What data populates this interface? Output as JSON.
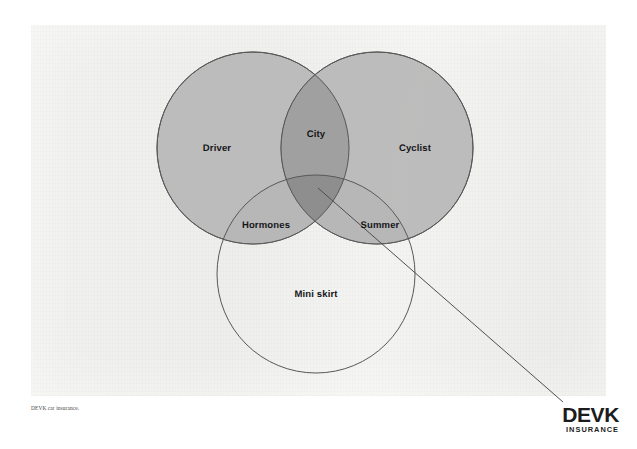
{
  "poster": {
    "background_color": "#f0f0ee",
    "page_color": "#ffffff"
  },
  "diagram": {
    "type": "venn",
    "set_count": 3,
    "fill_color": "#b5b5b5",
    "stroke_color": "#5a5a5a",
    "overlap_color": "#9a9a9a",
    "triple_overlap_color": "#8a8a8a",
    "sets": [
      {
        "id": "driver",
        "label": "Driver",
        "filled": true,
        "label_x": 217,
        "label_y": 148
      },
      {
        "id": "cyclist",
        "label": "Cyclist",
        "filled": true,
        "label_x": 415,
        "label_y": 148
      },
      {
        "id": "mini-skirt",
        "label": "Mini skirt",
        "filled": false,
        "label_x": 316,
        "label_y": 294
      }
    ],
    "intersections": [
      {
        "id": "city",
        "label": "City",
        "sets": [
          "driver",
          "cyclist"
        ],
        "label_x": 316,
        "label_y": 134
      },
      {
        "id": "hormones",
        "label": "Hormones",
        "sets": [
          "driver",
          "mini-skirt"
        ],
        "label_x": 266,
        "label_y": 225
      },
      {
        "id": "summer",
        "label": "Summer",
        "sets": [
          "cyclist",
          "mini-skirt"
        ],
        "label_x": 380,
        "label_y": 225
      }
    ],
    "pointer_line": {
      "from_x": 318,
      "from_y": 188,
      "to_x": 563,
      "to_y": 402,
      "color": "#4e4e4e"
    }
  },
  "footer": {
    "fineprint": "DEVK car insurance.",
    "logo_wordmark": "DEVK",
    "logo_tagline": "INSURANCE"
  }
}
